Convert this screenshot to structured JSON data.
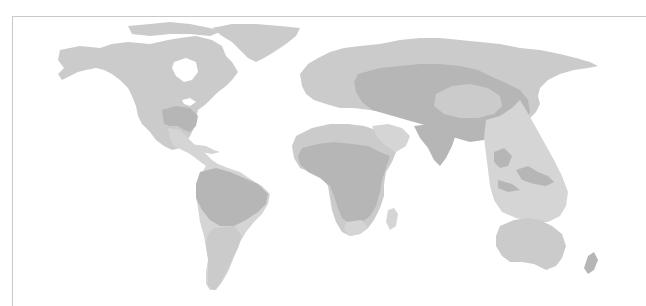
{
  "map": {
    "type": "world-distribution-map",
    "projection": "equirectangular-like",
    "has_text": false,
    "frame": {
      "left": 12,
      "top": 16,
      "color": "#c8c8c8"
    },
    "colors": {
      "background": "#ffffff",
      "land_base": "#cbcbcb",
      "region_pale": "#d5d5d5",
      "region_dark": "#b6b6b6"
    },
    "regions": [
      {
        "name": "north-america",
        "shade": "land_base"
      },
      {
        "name": "greenland",
        "shade": "land_base"
      },
      {
        "name": "southeast-usa",
        "shade": "region_dark"
      },
      {
        "name": "central-america",
        "shade": "region_pale"
      },
      {
        "name": "amazon-basin",
        "shade": "region_dark"
      },
      {
        "name": "southern-south-america",
        "shade": "land_base"
      },
      {
        "name": "europe",
        "shade": "land_base"
      },
      {
        "name": "central-eurasia",
        "shade": "region_dark"
      },
      {
        "name": "mongolia-oval",
        "shade": "land_base"
      },
      {
        "name": "north-africa",
        "shade": "land_base"
      },
      {
        "name": "sub-saharan-africa",
        "shade": "region_dark"
      },
      {
        "name": "madagascar",
        "shade": "region_pale"
      },
      {
        "name": "middle-east",
        "shade": "region_pale"
      },
      {
        "name": "india",
        "shade": "region_dark"
      },
      {
        "name": "southeast-asia-band",
        "shade": "region_pale"
      },
      {
        "name": "indonesia",
        "shade": "region_dark"
      },
      {
        "name": "australia",
        "shade": "land_base"
      },
      {
        "name": "new-zealand",
        "shade": "region_dark"
      }
    ]
  }
}
